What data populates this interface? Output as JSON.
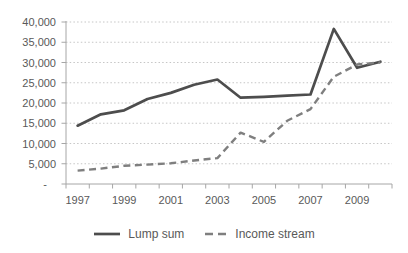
{
  "chart_data": {
    "type": "line",
    "title": "",
    "xlabel": "",
    "ylabel": "",
    "x": [
      1997,
      1998,
      1999,
      2000,
      2001,
      2002,
      2003,
      2004,
      2005,
      2006,
      2007,
      2008,
      2009,
      2010
    ],
    "xtick_labels": [
      "1997",
      "1999",
      "2001",
      "2003",
      "2005",
      "2007",
      "2009"
    ],
    "ytick_labels": [
      "-",
      "5,000",
      "10,000",
      "15,000",
      "20,000",
      "25,000",
      "30,000",
      "35,000",
      "40,000"
    ],
    "ylim": [
      0,
      40000
    ],
    "ytick_interval": 5000,
    "grid": "horizontal-dotted",
    "legend_position": "bottom-center",
    "series": [
      {
        "name": "Lump sum",
        "line_style": "solid",
        "color": "#4d4d4d",
        "values": [
          14400,
          17200,
          18200,
          21000,
          22500,
          24500,
          25800,
          21300,
          21500,
          21800,
          22100,
          38300,
          28700,
          30200
        ]
      },
      {
        "name": "Income stream",
        "line_style": "dashed",
        "color": "#7f7f7f",
        "values": [
          3300,
          3800,
          4500,
          4800,
          5100,
          5800,
          6400,
          12700,
          10400,
          15600,
          18500,
          26500,
          29500,
          30000
        ]
      }
    ]
  },
  "colors": {
    "background": "#ffffff",
    "axis_text": "#595959",
    "gridline": "#c6c6c6",
    "axis_line": "#a6a6a6"
  }
}
